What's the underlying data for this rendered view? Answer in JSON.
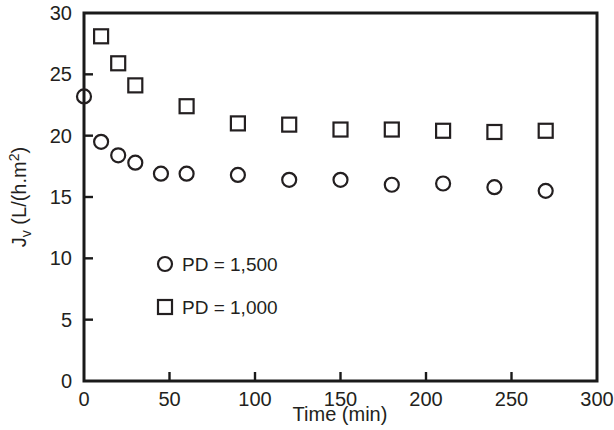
{
  "chart_data": {
    "type": "scatter",
    "title": "",
    "xlabel": "Time (min)",
    "ylabel": "J_v (L/(h.m2))",
    "ylabel_parts": {
      "main": "J",
      "subscript": "v",
      "unit_open": " (L/(h.m",
      "superscript": "2",
      "unit_close": "))"
    },
    "xlim": [
      0,
      300
    ],
    "ylim": [
      0,
      30
    ],
    "xticks": [
      0,
      50,
      100,
      150,
      200,
      250,
      300
    ],
    "yticks": [
      0,
      5,
      10,
      15,
      20,
      25,
      30
    ],
    "grid": false,
    "legend_position": "inside-lower-left",
    "marker_style": "open",
    "series": [
      {
        "name": "PD = 1,500",
        "marker": "circle",
        "x": [
          0,
          10,
          20,
          30,
          45,
          60,
          90,
          120,
          150,
          180,
          210,
          240,
          270
        ],
        "values": [
          23.2,
          19.5,
          18.4,
          17.8,
          16.9,
          16.9,
          16.8,
          16.4,
          16.4,
          16.0,
          16.1,
          15.8,
          15.5
        ]
      },
      {
        "name": "PD = 1,000",
        "marker": "square",
        "x": [
          10,
          20,
          30,
          60,
          90,
          120,
          150,
          180,
          210,
          240,
          270
        ],
        "values": [
          28.1,
          25.9,
          24.1,
          22.4,
          21.0,
          20.9,
          20.5,
          20.5,
          20.4,
          20.3,
          20.4
        ]
      }
    ]
  },
  "legend": {
    "entries": [
      {
        "label": "PD = 1,500",
        "marker": "circle"
      },
      {
        "label": "PD = 1,000",
        "marker": "square"
      }
    ]
  },
  "axes": {
    "x_title": "Time (min)",
    "x_tick_labels": [
      "0",
      "50",
      "100",
      "150",
      "200",
      "250",
      "300"
    ],
    "y_tick_labels": [
      "0",
      "5",
      "10",
      "15",
      "20",
      "25",
      "30"
    ]
  },
  "colors": {
    "marker": "#231f20",
    "axis": "#1a1a1a",
    "background": "#ffffff"
  }
}
